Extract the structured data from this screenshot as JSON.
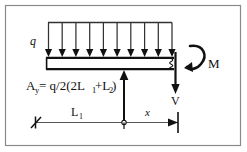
{
  "figure": {
    "background_color": "#ffffff",
    "ink_color": "#111111",
    "frame_color": "#8a8a8a"
  },
  "labels": {
    "distributed_load": "q",
    "moment": "M",
    "shear": "V",
    "reaction_prefix": "A",
    "reaction_subscript": "y",
    "reaction_equals": "= q/2(2L",
    "reaction_sub_1": "1",
    "reaction_mid": "+L",
    "reaction_sub_2": "2",
    "reaction_close": ")",
    "reaction_full": "A_y = q/2(2L1+L2)",
    "dim_length": "L",
    "dim_length_subscript": "1",
    "dim_x": "x"
  },
  "geometry": {
    "load_arrow_count": 10,
    "load_arrow_x_start": 48,
    "load_arrow_x_end": 172,
    "load_top_y": 22,
    "load_bottom_y": 56,
    "beam_left_x": 46,
    "beam_right_x": 174,
    "beam_top_y": 57,
    "beam_bottom_y": 70,
    "reaction_arrow_x": 124,
    "reaction_arrow_top_y": 70,
    "reaction_arrow_bottom_y": 122,
    "shear_arrow_x": 175,
    "shear_arrow_top_y": 52,
    "shear_arrow_bottom_y": 93,
    "moment_arc_cx": 196,
    "moment_arc_cy": 60,
    "dim_line_y": 122,
    "dim_left_x": 35,
    "dim_mid_x": 124,
    "dim_right_x": 178,
    "frame_x": 5,
    "frame_y": 5,
    "frame_w": 236,
    "frame_h": 141
  }
}
